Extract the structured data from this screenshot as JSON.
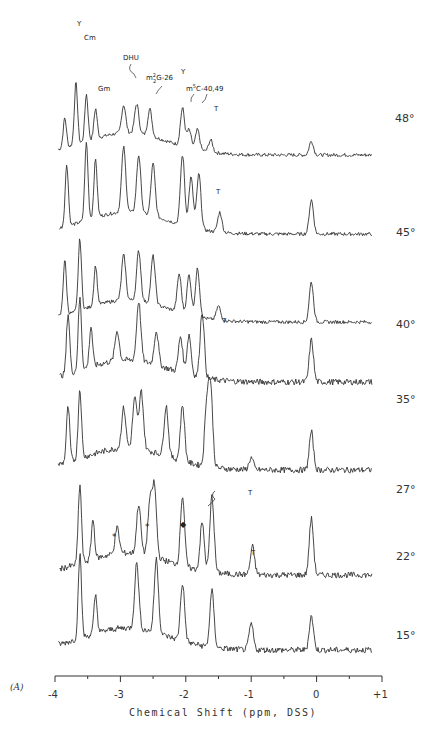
{
  "chart_data": {
    "type": "line",
    "subtype": "stacked NMR spectra (temperature series)",
    "title": "",
    "panel_label": "(A)",
    "xlabel": "Chemical Shift (ppm, DSS)",
    "ylabel": "",
    "xlim": [
      -4,
      1
    ],
    "x_ticks": [
      -4,
      -3,
      -2,
      -1,
      0,
      1
    ],
    "x_tick_labels": [
      "-4",
      "-3",
      "-2",
      "-1",
      "0",
      "+1"
    ],
    "x_minor_ticks": [
      -3.5,
      -2.5,
      -1.5,
      -0.5,
      0.5
    ],
    "grid": false,
    "legend": "none",
    "series": [
      {
        "name": "48°",
        "temperature": "48°",
        "baseline": 155,
        "peaks": [
          [
            -3.85,
            30
          ],
          [
            -3.68,
            62
          ],
          [
            -3.52,
            47
          ],
          [
            -3.38,
            30
          ],
          [
            -2.95,
            28
          ],
          [
            -2.75,
            30
          ],
          [
            -2.55,
            27
          ],
          [
            -2.05,
            38
          ],
          [
            -1.95,
            18
          ],
          [
            -1.82,
            20
          ],
          [
            -1.62,
            12
          ],
          [
            -0.08,
            14
          ]
        ]
      },
      {
        "name": "45°",
        "temperature": "45°",
        "baseline": 234,
        "peaks": [
          [
            -3.82,
            62
          ],
          [
            -3.52,
            78
          ],
          [
            -3.38,
            58
          ],
          [
            -2.95,
            65
          ],
          [
            -2.72,
            58
          ],
          [
            -2.5,
            52
          ],
          [
            -2.05,
            70
          ],
          [
            -1.92,
            50
          ],
          [
            -1.8,
            55
          ],
          [
            -1.48,
            20
          ],
          [
            -0.08,
            34
          ]
        ]
      },
      {
        "name": "40°",
        "temperature": "40°",
        "baseline": 322,
        "peaks": [
          [
            -3.85,
            55
          ],
          [
            -3.62,
            72
          ],
          [
            -3.38,
            40
          ],
          [
            -2.95,
            45
          ],
          [
            -2.72,
            50
          ],
          [
            -2.5,
            48
          ],
          [
            -2.1,
            38
          ],
          [
            -1.95,
            40
          ],
          [
            -1.82,
            48
          ],
          [
            -1.5,
            14
          ],
          [
            -0.08,
            40
          ]
        ]
      },
      {
        "name": "35°",
        "temperature": "35°",
        "baseline": 382,
        "peaks": [
          [
            -3.8,
            60
          ],
          [
            -3.62,
            72
          ],
          [
            -3.45,
            40
          ],
          [
            -3.05,
            30
          ],
          [
            -2.72,
            60
          ],
          [
            -2.45,
            34
          ],
          [
            -2.08,
            36
          ],
          [
            -1.95,
            40
          ],
          [
            -1.75,
            66
          ],
          [
            -0.08,
            42
          ]
        ]
      },
      {
        "name": "27°",
        "temperature": "27°",
        "baseline": 470,
        "peaks": [
          [
            -3.8,
            55
          ],
          [
            -3.62,
            70
          ],
          [
            -2.95,
            40
          ],
          [
            -2.78,
            50
          ],
          [
            -2.68,
            58
          ],
          [
            -2.3,
            50
          ],
          [
            -2.05,
            56
          ],
          [
            -1.68,
            60
          ],
          [
            -1.62,
            76
          ],
          [
            -1.0,
            12
          ],
          [
            -0.08,
            38
          ]
        ]
      },
      {
        "name": "22°",
        "temperature": "22°",
        "baseline": 575,
        "peaks": [
          [
            -3.62,
            78
          ],
          [
            -3.42,
            40
          ],
          [
            -3.05,
            26
          ],
          [
            -2.72,
            50
          ],
          [
            -2.55,
            52
          ],
          [
            -2.48,
            70
          ],
          [
            -2.05,
            70
          ],
          [
            -1.75,
            48
          ],
          [
            -1.6,
            76
          ],
          [
            -0.98,
            28
          ],
          [
            -0.08,
            56
          ]
        ]
      },
      {
        "name": "15°",
        "temperature": "15°",
        "baseline": 650,
        "peaks": [
          [
            -3.62,
            85
          ],
          [
            -3.38,
            38
          ],
          [
            -2.75,
            66
          ],
          [
            -2.45,
            74
          ],
          [
            -2.05,
            58
          ],
          [
            -1.6,
            56
          ],
          [
            -1.0,
            26
          ],
          [
            -0.08,
            34
          ]
        ]
      }
    ],
    "annotations": [
      {
        "text": "Y",
        "x": -3.68,
        "spectrum": "48°"
      },
      {
        "text": "Cm",
        "x": -3.52,
        "spectrum": "48°"
      },
      {
        "text": "Gm",
        "x": -3.35,
        "spectrum": "48°"
      },
      {
        "text": "DHU",
        "x": -2.75,
        "spectrum": "48°"
      },
      {
        "text": "m2 2G-26",
        "x": -2.55,
        "spectrum": "48°"
      },
      {
        "text": "Y",
        "x": -2.05,
        "spectrum": "48°"
      },
      {
        "text": "m5C-40,49",
        "x": -1.9,
        "spectrum": "48°"
      },
      {
        "text": "T",
        "x": -1.62,
        "spectrum": "48°"
      },
      {
        "text": "T",
        "x": -1.48,
        "spectrum": "45°"
      },
      {
        "text": "T",
        "x": -1.5,
        "spectrum": "40°"
      },
      {
        "text": "T",
        "x": -1.0,
        "spectrum": "27°"
      },
      {
        "text": "arrow",
        "x": -1.62,
        "spectrum": "27°"
      },
      {
        "text": "*",
        "x": -3.1,
        "spectrum": "22°"
      },
      {
        "text": "*",
        "x": -2.6,
        "spectrum": "22°"
      },
      {
        "text": "◆",
        "x": -2.05,
        "spectrum": "22°"
      },
      {
        "text": "T",
        "x": -0.98,
        "spectrum": "22°"
      }
    ]
  },
  "labels": {
    "panel": "(A)",
    "xlabel": "Chemical Shift (ppm, DSS)",
    "ticks": [
      "-4",
      "-3",
      "-2",
      "-1",
      "0",
      "+1"
    ],
    "temps": [
      "48°",
      "45°",
      "40°",
      "35°",
      "27°",
      "22°",
      "15°"
    ],
    "ann": {
      "y1": "Y",
      "cm": "Cm",
      "gm": "Gm",
      "dhu": "DHU",
      "m22g": "m",
      "m22g_sup": "2",
      "m22g_sub": "2",
      "m22g_rest": "G-26",
      "y2": "Y",
      "m5c": "m",
      "m5c_sup": "5",
      "m5c_rest": "C-40,49",
      "t48": "T",
      "t45": "T",
      "t40": "T",
      "t27": "T",
      "t22": "T",
      "star1": "*",
      "star2": "*",
      "diamond": "◆"
    }
  }
}
